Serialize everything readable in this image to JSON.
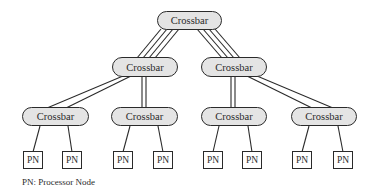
{
  "diagram": {
    "colors": {
      "crossbar_fill": "#e4e4e4",
      "stroke": "#2a2a2a",
      "pn_fill": "#ffffff"
    },
    "levels": {
      "root": {
        "label": "Crossbar"
      },
      "mid": [
        {
          "label": "Crossbar"
        },
        {
          "label": "Crossbar"
        }
      ],
      "leaf": [
        {
          "label": "Crossbar"
        },
        {
          "label": "Crossbar"
        },
        {
          "label": "Crossbar"
        },
        {
          "label": "Crossbar"
        }
      ]
    },
    "processor_nodes": [
      {
        "label": "PN"
      },
      {
        "label": "PN"
      },
      {
        "label": "PN"
      },
      {
        "label": "PN"
      },
      {
        "label": "PN"
      },
      {
        "label": "PN"
      },
      {
        "label": "PN"
      },
      {
        "label": "PN"
      }
    ],
    "links": {
      "root_to_mid": 4,
      "mid_to_leaf": 2,
      "leaf_to_pn": 1
    },
    "legend": "PN: Processor Node"
  }
}
